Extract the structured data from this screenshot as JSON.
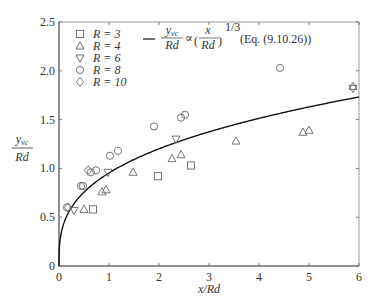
{
  "chart_data": {
    "type": "scatter",
    "title": "",
    "xlabel": "x/Rd",
    "ylabel": "y_vc / Rd",
    "xlim": [
      0,
      6
    ],
    "ylim": [
      0,
      2.5
    ],
    "xticks": [
      0,
      1,
      2,
      3,
      4,
      5,
      6
    ],
    "xtick_labels": [
      "0",
      "1",
      "2",
      "3",
      "4",
      "5",
      "6"
    ],
    "yticks": [
      0,
      0.5,
      1.0,
      1.5,
      2.0,
      2.5
    ],
    "ytick_labels": [
      "0",
      "0.5",
      "1.0",
      "1.5",
      "2.0",
      "2.5"
    ],
    "grid": false,
    "legend_position": "upper left",
    "series": [
      {
        "name": "R = 3",
        "marker": "square",
        "points": [
          [
            0.68,
            0.58
          ],
          [
            1.98,
            0.92
          ],
          [
            2.64,
            1.03
          ]
        ]
      },
      {
        "name": "R = 4",
        "marker": "triangle-up",
        "points": [
          [
            0.5,
            0.58
          ],
          [
            0.86,
            0.76
          ],
          [
            0.94,
            0.78
          ],
          [
            1.48,
            0.96
          ],
          [
            2.26,
            1.1
          ],
          [
            2.44,
            1.14
          ],
          [
            3.54,
            1.28
          ],
          [
            4.88,
            1.37
          ],
          [
            5.0,
            1.39
          ],
          [
            5.88,
            1.84
          ]
        ]
      },
      {
        "name": "R = 6",
        "marker": "triangle-down",
        "points": [
          [
            0.3,
            0.57
          ],
          [
            0.98,
            0.96
          ],
          [
            2.34,
            1.3
          ],
          [
            5.88,
            1.82
          ]
        ]
      },
      {
        "name": "R = 8",
        "marker": "circle",
        "points": [
          [
            0.16,
            0.6
          ],
          [
            0.44,
            0.82
          ],
          [
            0.48,
            0.82
          ],
          [
            0.64,
            0.96
          ],
          [
            0.74,
            0.98
          ],
          [
            1.02,
            1.13
          ],
          [
            1.18,
            1.18
          ],
          [
            1.9,
            1.43
          ],
          [
            2.44,
            1.52
          ],
          [
            2.52,
            1.55
          ],
          [
            4.42,
            2.03
          ]
        ]
      },
      {
        "name": "R = 10",
        "marker": "diamond",
        "points": [
          [
            0.18,
            0.6
          ],
          [
            0.58,
            0.98
          ]
        ]
      }
    ],
    "fit_curve": {
      "name": "y_vc/Rd ∝ (x/Rd)^(1/3) (Eq. (9.10.26))",
      "form": "y = k * x^(1/3)",
      "k": 0.953,
      "exponent": 0.3333
    }
  },
  "legend": {
    "items": [
      {
        "symbol": "□",
        "label": "R = 3"
      },
      {
        "symbol": "△",
        "label": "R = 4"
      },
      {
        "symbol": "▽",
        "label": "R = 6"
      },
      {
        "symbol": "○",
        "label": "R = 8"
      },
      {
        "symbol": "◇",
        "label": "R = 10"
      }
    ],
    "curve_numerator": "y",
    "curve_numerator_sub": "vc",
    "curve_denominator": "Rd",
    "proportional": "∝",
    "paren_numerator": "x",
    "paren_denominator": "Rd",
    "exponent": "1/3",
    "equation_ref": "(Eq. (9.10.26))"
  },
  "axes": {
    "xlabel": "x/Rd",
    "ylabel_num": "y",
    "ylabel_sub": "vc",
    "ylabel_den": "Rd"
  }
}
